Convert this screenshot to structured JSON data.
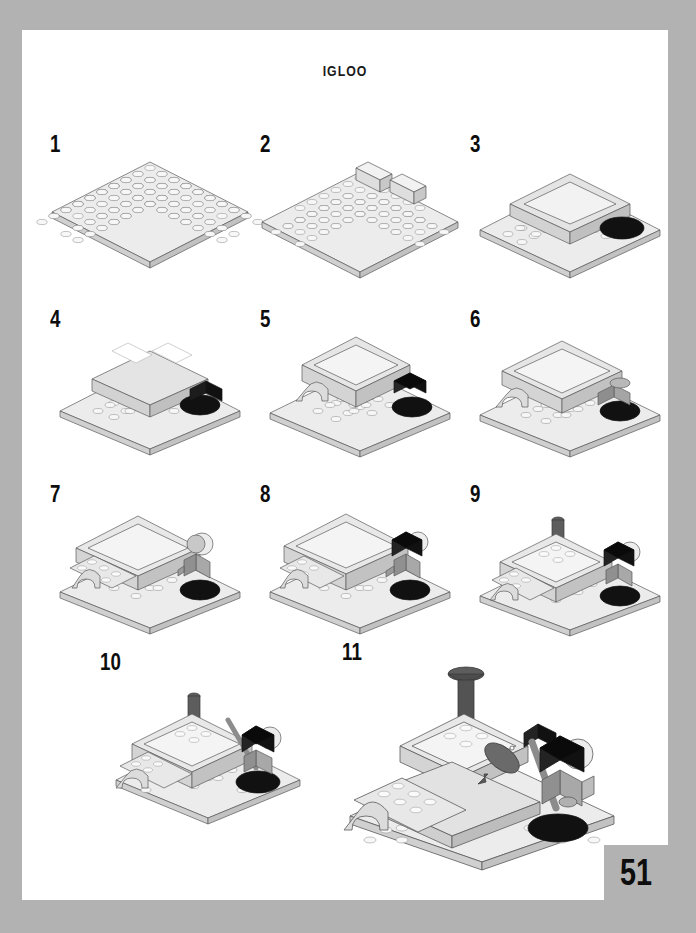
{
  "page": {
    "title": "IGLOO",
    "page_number": "51",
    "border_color": "#b2b2b2",
    "page_color": "#ffffff",
    "ink_color": "#0d0d0d"
  },
  "palette": {
    "brick_light": "#e8e8e8",
    "brick_top": "#f4f4f4",
    "brick_side": "#d2d2d2",
    "brick_shadow": "#bdbdbd",
    "brick_white": "#ffffff",
    "brick_black": "#111111",
    "brick_grey": "#9a9a9a",
    "brick_darkgrey": "#6f6f6f",
    "outline": "#555555"
  },
  "steps": [
    {
      "number": "1",
      "name": "step-1",
      "description": "White 16x16 baseplate placed flat",
      "new_parts": [
        "baseplate-16x16-white"
      ],
      "has_black_part": false,
      "has_minifigure": false
    },
    {
      "number": "2",
      "name": "step-2",
      "description": "Two light grey bricks added at the back of the baseplate",
      "new_parts": [
        "brick-1x4-light",
        "brick-1x2-light"
      ],
      "has_black_part": false,
      "has_minifigure": false
    },
    {
      "number": "3",
      "name": "step-3",
      "description": "Outer igloo wall ring built and a black rounded ice-hole plate added at the right",
      "new_parts": [
        "wall-ring-light",
        "plate-round-black"
      ],
      "has_black_part": true,
      "has_minifigure": false
    },
    {
      "number": "4",
      "name": "step-4",
      "description": "White plates capping the rear wall and a black brick beside the ice hole",
      "new_parts": [
        "plate-2x4-white",
        "brick-2x2-black"
      ],
      "has_black_part": true,
      "has_minifigure": false
    },
    {
      "number": "5",
      "name": "step-5",
      "description": "Arch doorway built into the front wall, second layer of dome walls added",
      "new_parts": [
        "arch-1x4-light",
        "brick-black-1x1"
      ],
      "has_black_part": true,
      "has_minifigure": false
    },
    {
      "number": "6",
      "name": "step-6",
      "description": "Dome roof plates laid over the walls, grey legs placed on the black ice plate",
      "new_parts": [
        "plate-dome-light",
        "minifig-legs-grey"
      ],
      "has_black_part": true,
      "has_minifigure": true
    },
    {
      "number": "7",
      "name": "step-7",
      "description": "Minifigure torso and head with helmet added; entrance tunnel plated",
      "new_parts": [
        "minifig-torso-grey",
        "minifig-head",
        "helmet-white"
      ],
      "has_black_part": true,
      "has_minifigure": true
    },
    {
      "number": "8",
      "name": "step-8",
      "description": "Black hood piece fitted over the minifigure head, roof tiles added",
      "new_parts": [
        "hood-black",
        "tile-light"
      ],
      "has_black_part": true,
      "has_minifigure": true
    },
    {
      "number": "9",
      "name": "step-9",
      "description": "Dark grey chimney antenna pressed into the top of the dome",
      "new_parts": [
        "antenna-dark-grey"
      ],
      "has_black_part": true,
      "has_minifigure": true
    },
    {
      "number": "10",
      "name": "step-10",
      "description": "Fishing rod placed into the minifigure hand",
      "new_parts": [
        "fishing-rod-grey"
      ],
      "has_black_part": true,
      "has_minifigure": true
    },
    {
      "number": "11",
      "name": "step-11",
      "description": "Finished igloo: chimney cap added and a fish hooked on the line",
      "new_parts": [
        "chimney-cap-dark-grey",
        "fish-dark-grey",
        "string-black"
      ],
      "has_black_part": true,
      "has_minifigure": true
    }
  ]
}
